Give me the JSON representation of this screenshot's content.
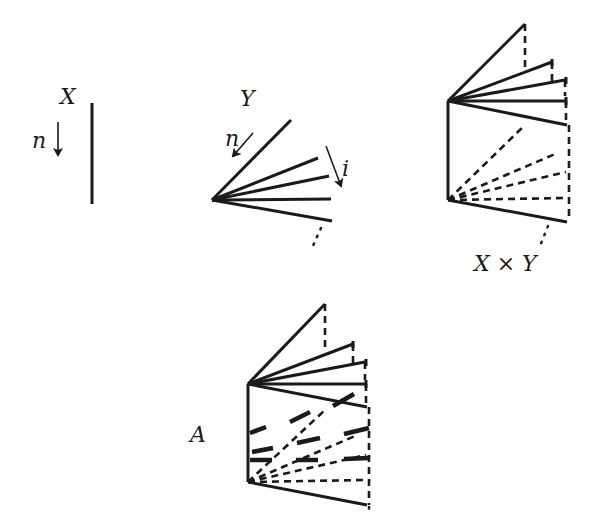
{
  "figure": {
    "panels": [
      {
        "id": "X",
        "label": "X",
        "arrow_label": "n",
        "description": "vertical segment with downward arrow n"
      },
      {
        "id": "Y",
        "label": "Y",
        "arrow_labels": [
          "n",
          "i"
        ],
        "description": "fan of rays from a point, ordered by i, with n arrow along first ray"
      },
      {
        "id": "XxY",
        "label": "X × Y",
        "description": "product of segment and fan: top fan solid, bottom fan dashed, joined by vertical dashed lines"
      },
      {
        "id": "A",
        "label": "A",
        "description": "product shape with thick dashed segments highlighting a subset"
      }
    ],
    "labels": {
      "x": "X",
      "x_arrow": "n",
      "y": "Y",
      "y_arrow_n": "n",
      "y_arrow_i": "i",
      "product": "X × Y",
      "a": "A"
    }
  }
}
